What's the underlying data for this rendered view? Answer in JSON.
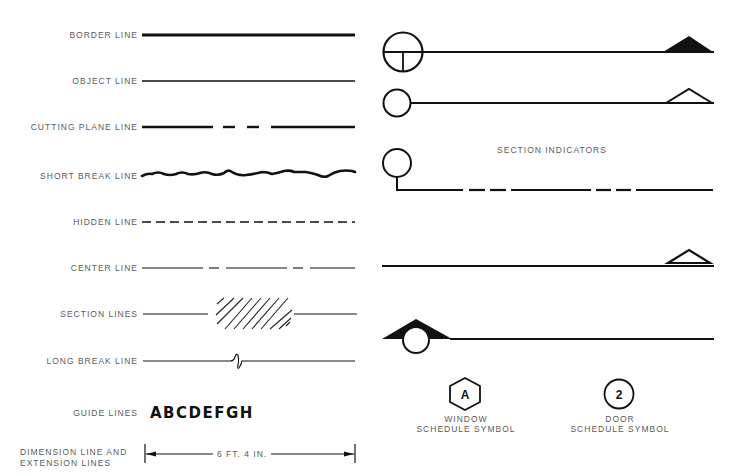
{
  "line_types": {
    "labels": {
      "border": "BORDER LINE",
      "object": "OBJECT LINE",
      "cutting_plane": "CUTTING PLANE LINE",
      "short_break": "SHORT BREAK LINE",
      "hidden": "HIDDEN LINE",
      "center": "CENTER LINE",
      "section": "SECTION LINES",
      "long_break": "LONG BREAK LINE",
      "guide": "GUIDE LINES",
      "dimension_line1": "DIMENSION LINE AND",
      "dimension_line2": "EXTENSION LINES"
    },
    "guide_letters": "ABCDEFGH",
    "dimension_value": "6 FT. 4 IN."
  },
  "section_indicators": {
    "title": "SECTION INDICATORS"
  },
  "schedule_symbols": {
    "window": {
      "glyph": "A",
      "label_line1": "WINDOW",
      "label_line2": "SCHEDULE SYMBOL",
      "shape": "hexagon"
    },
    "door": {
      "glyph": "2",
      "label_line1": "DOOR",
      "label_line2": "SCHEDULE SYMBOL",
      "shape": "circle"
    }
  },
  "colors": {
    "ink": "#111111",
    "label": "#5a5a5a",
    "background": "#ffffff"
  }
}
